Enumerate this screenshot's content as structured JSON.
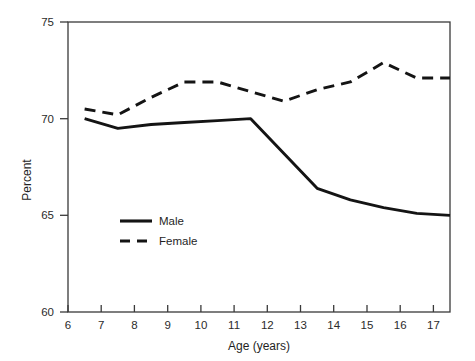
{
  "chart_data": {
    "type": "line",
    "title": "",
    "xlabel": "Age (years)",
    "ylabel": "Percent",
    "xlim": [
      6,
      17.5
    ],
    "ylim": [
      60,
      75
    ],
    "grid": false,
    "legend_position": "inside-left",
    "x_ticks": [
      6,
      7,
      8,
      9,
      10,
      11,
      12,
      13,
      14,
      15,
      16,
      17
    ],
    "x_tick_labels": [
      "6",
      "7",
      "8",
      "9",
      "10",
      "11",
      "12",
      "13",
      "14",
      "15",
      "16",
      "17"
    ],
    "y_ticks": [
      60,
      65,
      70,
      75
    ],
    "y_tick_labels": [
      "60",
      "65",
      "70",
      "75"
    ],
    "x": [
      6.5,
      7.5,
      8.5,
      9.5,
      10.5,
      11.5,
      12.5,
      13.5,
      14.5,
      15.5,
      16.5,
      17.5
    ],
    "series": [
      {
        "name": "Male",
        "style": "solid",
        "values": [
          70.0,
          69.5,
          69.7,
          69.8,
          69.9,
          70.0,
          68.2,
          66.4,
          65.8,
          65.4,
          65.1,
          65.0
        ]
      },
      {
        "name": "Female",
        "style": "dashed",
        "values": [
          70.5,
          70.2,
          71.1,
          71.9,
          71.9,
          71.4,
          70.9,
          71.5,
          71.9,
          72.9,
          72.1,
          72.1
        ]
      }
    ]
  },
  "axes": {
    "y_label": "Percent",
    "x_label": "Age (years)",
    "y_tick_labels": [
      "75",
      "70",
      "65",
      "60"
    ],
    "x_tick_labels": [
      "6",
      "7",
      "8",
      "9",
      "10",
      "11",
      "12",
      "13",
      "14",
      "15",
      "16",
      "17"
    ]
  },
  "legend": {
    "entries": [
      {
        "label": "Male",
        "style": "solid"
      },
      {
        "label": "Female",
        "style": "dashed"
      }
    ]
  },
  "colors": {
    "line": "#141414",
    "axis": "#3a3a3a",
    "text": "#1f1f1f",
    "background": "#ffffff"
  }
}
